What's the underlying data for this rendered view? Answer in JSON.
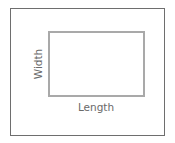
{
  "diagram": {
    "type": "rectangle-dimensions",
    "labels": {
      "width": "Width",
      "length": "Length"
    },
    "colors": {
      "outer_border": "#6e6e6e",
      "inner_border": "#a9a9a9",
      "text": "#6a6a6a"
    }
  }
}
